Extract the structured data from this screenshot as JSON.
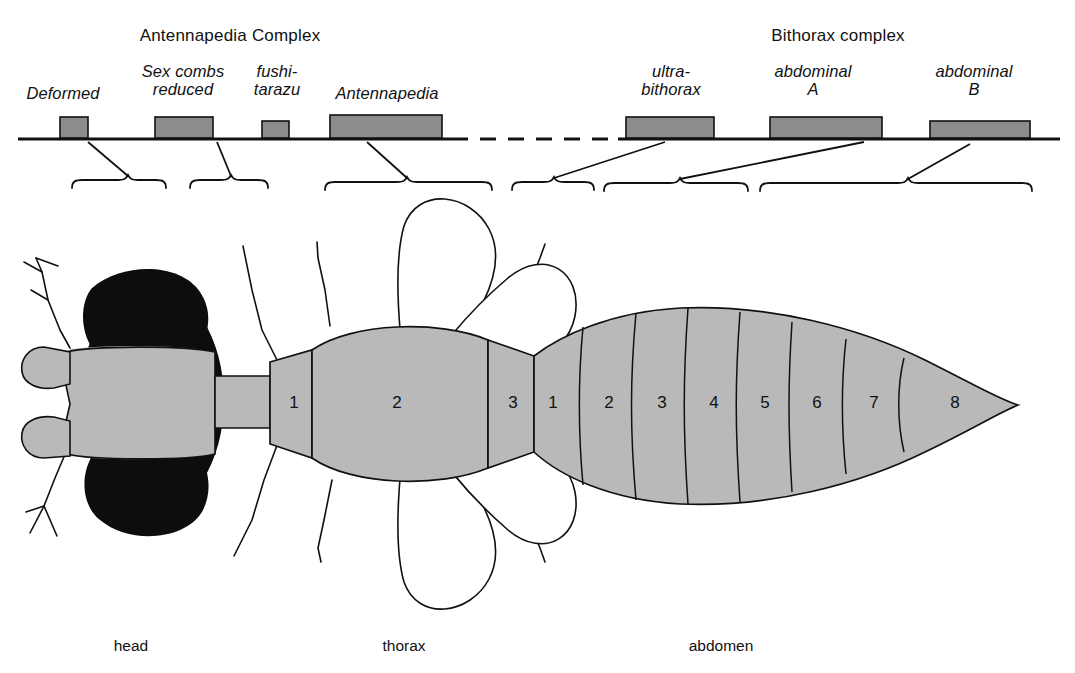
{
  "figure": {
    "kind": "hox-gene-complex-to-body-segment-map",
    "organism": "Drosophila",
    "background_color": "#ffffff",
    "ink_color": "#111111",
    "gene_box_fill": "#8c8c8c",
    "body_fill": "#b9b9b9",
    "body_dark_fill": "#0d0d0d"
  },
  "complexes": [
    {
      "id": "antennapedia-complex",
      "title": "Antennapedia Complex",
      "center_x": 230,
      "title_y": 26
    },
    {
      "id": "bithorax-complex",
      "title": "Bithorax complex",
      "center_x": 838,
      "title_y": 26
    }
  ],
  "chromosome": {
    "line_y": 139,
    "x_start": 18,
    "x_end": 1060,
    "dashed_gap": {
      "x_start": 452,
      "x_end": 618
    }
  },
  "genes": [
    {
      "id": "deformed",
      "label": "Deformed",
      "label_lines": [
        "Deformed"
      ],
      "label_center_x": 63,
      "label_top_y": 84,
      "box": {
        "x": 60,
        "y": 117,
        "w": 28,
        "h": 19
      }
    },
    {
      "id": "sex-combs-reduced",
      "label": "Sex combs reduced",
      "label_lines": [
        "Sex combs",
        "reduced"
      ],
      "label_center_x": 183,
      "label_top_y": 62,
      "box": {
        "x": 155,
        "y": 117,
        "w": 58,
        "h": 19
      }
    },
    {
      "id": "fushi-tarazu",
      "label": "fushi-tarazu",
      "label_lines": [
        "fushi-",
        "tarazu"
      ],
      "label_center_x": 277,
      "label_top_y": 62,
      "box": {
        "x": 262,
        "y": 119,
        "w": 27,
        "h": 17
      }
    },
    {
      "id": "ultrabithorax",
      "label": "ultra-bithorax",
      "label_lines": [
        "ultra-",
        "bithorax"
      ],
      "label_center_x": 671,
      "label_top_y": 62,
      "box": {
        "x": 626,
        "y": 117,
        "w": 88,
        "h": 19
      }
    },
    {
      "id": "antennapedia",
      "label": "Antennapedia",
      "label_lines": [
        "Antennapedia"
      ],
      "label_center_x": 387,
      "label_top_y": 84,
      "box": {
        "x": 330,
        "y": 115,
        "w": 112,
        "h": 21
      }
    },
    {
      "id": "abdominal-a",
      "label": "abdominal A",
      "label_lines": [
        "abdominal",
        "A"
      ],
      "label_center_x": 813,
      "label_top_y": 62,
      "box": {
        "x": 770,
        "y": 117,
        "w": 112,
        "h": 19
      }
    },
    {
      "id": "abdominal-b",
      "label": "abdominal B",
      "label_lines": [
        "abdominal",
        "B"
      ],
      "label_center_x": 974,
      "label_top_y": 62,
      "box": {
        "x": 930,
        "y": 119,
        "w": 100,
        "h": 17
      }
    }
  ],
  "leaders": [
    {
      "id": "leader-deformed",
      "from_x": 88,
      "from_y": 141,
      "to_x": 128,
      "to_y": 175
    },
    {
      "id": "leader-sex-combs",
      "from_x": 217,
      "from_y": 141,
      "to_x": 231,
      "to_y": 175
    },
    {
      "id": "leader-antennapedia",
      "from_x": 367,
      "from_y": 141,
      "to_x": 407,
      "to_y": 177
    },
    {
      "id": "leader-ultrabithorax",
      "from_x": 665,
      "from_y": 141,
      "to_x": 554,
      "to_y": 177
    },
    {
      "id": "leader-abdominal-a",
      "from_x": 864,
      "from_y": 141,
      "to_x": 680,
      "to_y": 178
    },
    {
      "id": "leader-abdominal-b",
      "from_x": 970,
      "from_y": 143,
      "to_x": 908,
      "to_y": 178
    }
  ],
  "braces": [
    {
      "id": "brace-head-anterior",
      "x_start": 72,
      "x_end": 166,
      "tip_x": 128,
      "y": 182
    },
    {
      "id": "brace-head-posterior",
      "x_start": 190,
      "x_end": 268,
      "tip_x": 231,
      "y": 182
    },
    {
      "id": "brace-thorax-1-2",
      "x_start": 325,
      "x_end": 492,
      "tip_x": 407,
      "y": 184
    },
    {
      "id": "brace-thorax-3",
      "x_start": 512,
      "x_end": 594,
      "tip_x": 554,
      "y": 184
    },
    {
      "id": "brace-abdomen-1-4",
      "x_start": 604,
      "x_end": 748,
      "tip_x": 680,
      "y": 185
    },
    {
      "id": "brace-abdomen-5-8",
      "x_start": 760,
      "x_end": 1032,
      "tip_x": 908,
      "y": 185
    }
  ],
  "body_regions": [
    {
      "id": "region-head",
      "label": "head",
      "center_x": 131,
      "label_y": 637
    },
    {
      "id": "region-thorax",
      "label": "thorax",
      "center_x": 404,
      "label_y": 637
    },
    {
      "id": "region-abdomen",
      "label": "abdomen",
      "center_x": 721,
      "label_y": 637
    }
  ],
  "segments": {
    "thorax": [
      {
        "num": "1",
        "x": 294,
        "y": 404
      },
      {
        "num": "2",
        "x": 397,
        "y": 404
      },
      {
        "num": "3",
        "x": 513,
        "y": 404
      }
    ],
    "abdomen": [
      {
        "num": "1",
        "x": 553,
        "y": 404
      },
      {
        "num": "2",
        "x": 609,
        "y": 404
      },
      {
        "num": "3",
        "x": 662,
        "y": 404
      },
      {
        "num": "4",
        "x": 714,
        "y": 404
      },
      {
        "num": "5",
        "x": 765,
        "y": 404
      },
      {
        "num": "6",
        "x": 817,
        "y": 404
      },
      {
        "num": "7",
        "x": 874,
        "y": 404
      },
      {
        "num": "8",
        "x": 955,
        "y": 404
      }
    ]
  }
}
